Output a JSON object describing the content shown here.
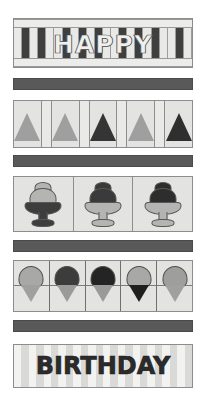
{
  "artwork": {
    "title": "Happy Birthday banner panel",
    "background_color": "#ffffff",
    "width": 206,
    "height": 404
  },
  "palette": {
    "white": "#ffffff",
    "paper": "#ededec",
    "light_gray": "#d2d2d0",
    "mid_gray": "#9a9a9a",
    "sash_gray": "#595959",
    "dark_gray": "#3a3a3a",
    "near_black": "#262626",
    "outline": "#6f6f6f"
  },
  "bands": [
    {
      "id": "happy-band",
      "name": "happy-word-band",
      "kind": "text-keys",
      "text": "HAPPY",
      "key_count": 22,
      "top": 18,
      "left": 13,
      "width": 180,
      "height": 50
    },
    {
      "id": "sash-1",
      "name": "sash-divider-1",
      "kind": "sash",
      "color": "#595959",
      "top": 78,
      "left": 13,
      "width": 180,
      "height": 12
    },
    {
      "id": "tree-band",
      "name": "party-hat-band",
      "kind": "triangles",
      "top": 100,
      "left": 13,
      "width": 180,
      "height": 48,
      "cells": [
        {
          "type": "motif",
          "fill": "#9f9f9f",
          "label": "party-hat-light"
        },
        {
          "type": "spacer",
          "fill": "#e9e9e7",
          "label": "spacer"
        },
        {
          "type": "motif",
          "fill": "#9f9f9f",
          "label": "party-hat-light"
        },
        {
          "type": "spacer",
          "fill": "#e9e9e7",
          "label": "spacer"
        },
        {
          "type": "motif",
          "fill": "#353535",
          "label": "party-hat-dark"
        },
        {
          "type": "spacer",
          "fill": "#e9e9e7",
          "label": "spacer"
        },
        {
          "type": "motif",
          "fill": "#9f9f9f",
          "label": "party-hat-light"
        },
        {
          "type": "spacer",
          "fill": "#e9e9e7",
          "label": "spacer"
        },
        {
          "type": "motif",
          "fill": "#2f2f2f",
          "label": "party-hat-dark"
        }
      ]
    },
    {
      "id": "sash-2",
      "name": "sash-divider-2",
      "kind": "sash",
      "color": "#595959",
      "top": 155,
      "left": 13,
      "width": 180,
      "height": 12
    },
    {
      "id": "sundae-band",
      "name": "sundae-band",
      "kind": "sundaes",
      "top": 176,
      "left": 13,
      "width": 180,
      "height": 56,
      "cells": [
        {
          "label": "sundae-light-scoop-dark-bowl",
          "scoop": "#b4b4b2",
          "bowl": "#3d3d3d"
        },
        {
          "label": "sundae-dark-scoop-light-bowl",
          "scoop": "#3a3a3a",
          "bowl": "#b4b4b2"
        },
        {
          "label": "sundae-dark-scoop-light-bowl",
          "scoop": "#2d2d2d",
          "bowl": "#b4b4b2"
        }
      ]
    },
    {
      "id": "sash-3",
      "name": "sash-divider-3",
      "kind": "sash",
      "color": "#595959",
      "top": 240,
      "left": 13,
      "width": 180,
      "height": 12
    },
    {
      "id": "cone-band",
      "name": "ice-cream-cone-band",
      "kind": "cones",
      "top": 260,
      "left": 13,
      "width": 180,
      "height": 52,
      "cells": [
        {
          "label": "cone-light-scoop",
          "scoop": "#a8a8a6",
          "cone": "#a0a09e"
        },
        {
          "label": "cone-dark-scoop",
          "scoop": "#3c3c3c",
          "cone": "#9a9a98"
        },
        {
          "label": "cone-darkest-scoop",
          "scoop": "#242424",
          "cone": "#9a9a98"
        },
        {
          "label": "cone-light-scoop-dark-cone",
          "scoop": "#a8a8a6",
          "cone": "#1f1f1f"
        },
        {
          "label": "cone-light-scoop",
          "scoop": "#9e9e9c",
          "cone": "#a0a09e"
        }
      ]
    },
    {
      "id": "sash-4",
      "name": "sash-divider-4",
      "kind": "sash",
      "color": "#595959",
      "top": 320,
      "left": 13,
      "width": 180,
      "height": 12
    },
    {
      "id": "bday-band",
      "name": "birthday-word-band",
      "kind": "text-stripes",
      "text": "BIRTHDAY",
      "stripe_count": 24,
      "top": 344,
      "left": 13,
      "width": 180,
      "height": 44
    }
  ],
  "labels": {
    "happy": "HAPPY",
    "birthday": "BIRTHDAY"
  }
}
